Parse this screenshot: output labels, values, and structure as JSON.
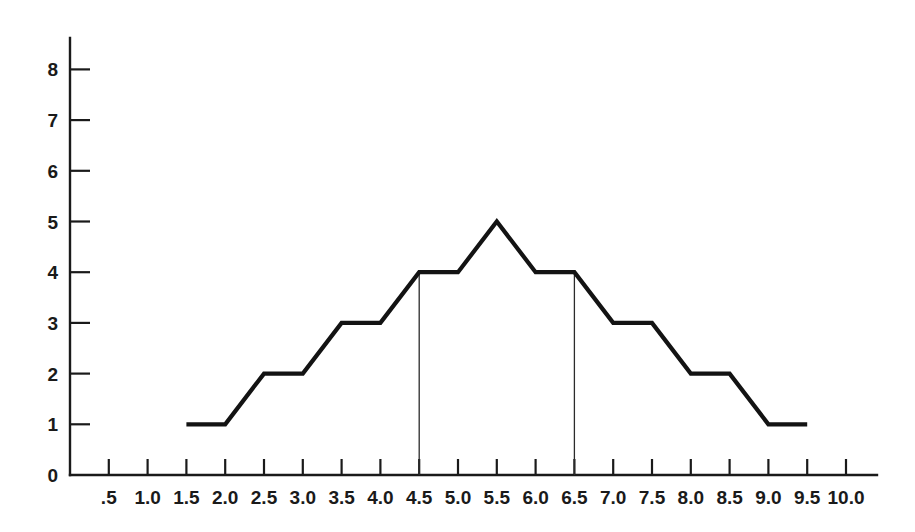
{
  "chart_data": {
    "type": "line",
    "title": "",
    "subtitle": "",
    "xlabel": "",
    "ylabel": "",
    "xlim": [
      0,
      10.4
    ],
    "ylim": [
      0,
      8.4
    ],
    "grid": false,
    "legend": null,
    "x_tick_labels": [
      ".5",
      "1.0",
      "1.5",
      "2.0",
      "2.5",
      "3.0",
      "3.5",
      "4.0",
      "4.5",
      "5.0",
      "5.5",
      "6.0",
      "6.5",
      "7.0",
      "7.5",
      "8.0",
      "8.5",
      "9.0",
      "9.5",
      "10.0"
    ],
    "x_tick_values": [
      0.5,
      1.0,
      1.5,
      2.0,
      2.5,
      3.0,
      3.5,
      4.0,
      4.5,
      5.0,
      5.5,
      6.0,
      6.5,
      7.0,
      7.5,
      8.0,
      8.5,
      9.0,
      9.5,
      10.0
    ],
    "y_tick_labels": [
      "0",
      "1",
      "2",
      "3",
      "4",
      "5",
      "6",
      "7",
      "8"
    ],
    "y_tick_values": [
      0,
      1,
      2,
      3,
      4,
      5,
      6,
      7,
      8
    ],
    "series": [
      {
        "name": "frequency",
        "points": [
          [
            1.5,
            1
          ],
          [
            2.0,
            1
          ],
          [
            2.5,
            2
          ],
          [
            3.0,
            2
          ],
          [
            3.5,
            3
          ],
          [
            4.0,
            3
          ],
          [
            4.5,
            4
          ],
          [
            5.0,
            4
          ],
          [
            5.5,
            5
          ],
          [
            6.0,
            4
          ],
          [
            6.5,
            4
          ],
          [
            7.0,
            3
          ],
          [
            7.5,
            3
          ],
          [
            8.0,
            2
          ],
          [
            8.5,
            2
          ],
          [
            9.0,
            1
          ],
          [
            9.5,
            1
          ]
        ]
      }
    ],
    "annotations": [
      {
        "name": "reference-line-lower",
        "type": "vertical-line",
        "x": 4.5,
        "y_from": 0,
        "y_to": 4
      },
      {
        "name": "reference-line-upper",
        "type": "vertical-line",
        "x": 6.5,
        "y_from": 0,
        "y_to": 4
      }
    ],
    "colors": {
      "data_line": "#131313",
      "axis": "#1a1a1a",
      "reference_line": "#2b2b2b",
      "background": "#ffffff"
    }
  }
}
